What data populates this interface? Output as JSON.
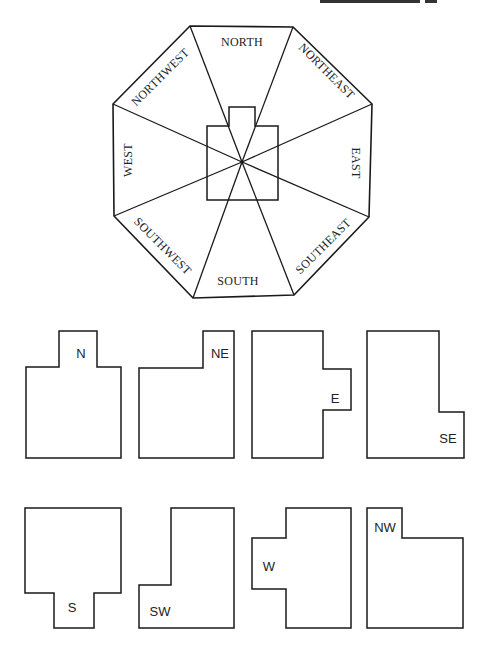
{
  "diagram": {
    "compass": {
      "labels": {
        "north": "NORTH",
        "northeast": "NORTHEAST",
        "east": "EAST",
        "southeast": "SOUTHEAST",
        "south": "SOUTH",
        "southwest": "SOUTHWEST",
        "west": "WEST",
        "northwest": "NORTHWEST"
      }
    },
    "plans": [
      {
        "direction": "north",
        "label": "N"
      },
      {
        "direction": "northeast",
        "label": "NE"
      },
      {
        "direction": "east",
        "label": "E"
      },
      {
        "direction": "southeast",
        "label": "SE"
      },
      {
        "direction": "south",
        "label": "S"
      },
      {
        "direction": "southwest",
        "label": "SW"
      },
      {
        "direction": "west",
        "label": "W"
      },
      {
        "direction": "northwest",
        "label": "NW"
      }
    ],
    "colors": {
      "line": "#1a1a1a",
      "background": "#ffffff"
    }
  }
}
